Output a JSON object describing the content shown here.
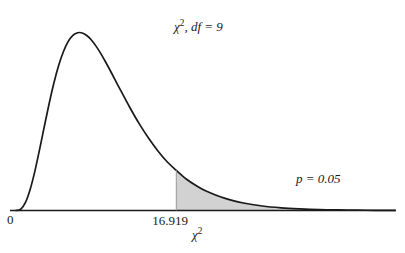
{
  "chart_data": {
    "type": "area",
    "title": "",
    "subtitle": "",
    "xlabel": "χ²",
    "ylabel": "",
    "grid": false,
    "legend": "none",
    "distribution": "chi-square",
    "df": 9,
    "xlim": [
      0,
      40
    ],
    "ylim": [
      0,
      0.11
    ],
    "critical_value": 16.919,
    "tail_area": 0.05,
    "tail_side": "right",
    "shaded_fill": "#d2d2d2",
    "curve_color": "#1a1a1a",
    "axis_color": "#1a1a1a",
    "background": "#ffffff",
    "tick_labels": [
      "0",
      "16.919"
    ],
    "annotations": [
      {
        "text": "χ², df = 9",
        "x": 20.5,
        "y": 0.088
      },
      {
        "text": "p = 0.05",
        "x": 32.5,
        "y": 0.018
      }
    ],
    "x": [
      0,
      0.5,
      1,
      1.5,
      2,
      2.5,
      3,
      3.5,
      4,
      4.5,
      5,
      5.5,
      6,
      6.5,
      7,
      7.5,
      8,
      8.5,
      9,
      9.5,
      10,
      11,
      12,
      13,
      14,
      15,
      16,
      16.919,
      18,
      19,
      20,
      22,
      24,
      26,
      28,
      30,
      32,
      34,
      36,
      38,
      40
    ],
    "y": [
      0,
      0.0007,
      0.0045,
      0.0119,
      0.0222,
      0.0344,
      0.0473,
      0.0599,
      0.0714,
      0.0812,
      0.0889,
      0.0945,
      0.098,
      0.0995,
      0.0994,
      0.0978,
      0.0952,
      0.0916,
      0.0874,
      0.0827,
      0.0778,
      0.0677,
      0.0578,
      0.0486,
      0.0404,
      0.0332,
      0.027,
      0.0225,
      0.0175,
      0.014,
      0.0111,
      0.0069,
      0.0042,
      0.0025,
      0.0015,
      0.0009,
      0.0005,
      0.0003,
      0.0002,
      0.0001,
      5e-05
    ]
  },
  "labels": {
    "df_prefix": "χ",
    "df_sup": "2",
    "df_rest": ", df = 9",
    "df_full": "χ², df = 9",
    "p_value": "p = 0.05",
    "origin": "0",
    "axis_chi_prefix": "χ",
    "axis_chi_sup": "2",
    "axis_chi_full": "χ²",
    "critical": "16.919"
  }
}
